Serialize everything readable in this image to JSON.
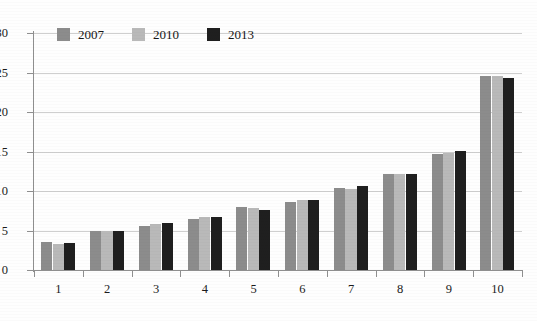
{
  "chart_data": {
    "type": "bar",
    "title": "",
    "subtitle": "",
    "xlabel": "",
    "ylabel": "",
    "categories": [
      "1",
      "2",
      "3",
      "4",
      "5",
      "6",
      "7",
      "8",
      "9",
      "10"
    ],
    "series": [
      {
        "name": "2007",
        "color": "#8c8c8c",
        "values": [
          3.6,
          5.0,
          5.6,
          6.5,
          8.0,
          8.6,
          10.4,
          12.2,
          14.7,
          24.6
        ]
      },
      {
        "name": "2010",
        "color": "#b9b9b9",
        "values": [
          3.3,
          5.0,
          5.8,
          6.7,
          7.9,
          8.9,
          10.2,
          12.2,
          14.8,
          24.6
        ]
      },
      {
        "name": "2013",
        "color": "#1f1f1f",
        "values": [
          3.4,
          5.0,
          6.0,
          6.7,
          7.6,
          8.9,
          10.6,
          12.1,
          15.1,
          24.3
        ]
      }
    ],
    "ylim": [
      0,
      30
    ],
    "yticks": [
      0,
      5,
      10,
      15,
      20,
      25,
      30
    ],
    "ytick_labels": [
      "0",
      "5",
      "10",
      "15",
      "20",
      "25",
      "30"
    ],
    "grid": true,
    "grid_axis": "y",
    "legend_position": "top-left"
  },
  "legend": {
    "items": [
      {
        "label": "2007",
        "color": "#8c8c8c"
      },
      {
        "label": "2010",
        "color": "#b9b9b9"
      },
      {
        "label": "2013",
        "color": "#1f1f1f"
      }
    ]
  },
  "colors": {
    "background": "#fefefe",
    "gridline": "#cfcfcf",
    "axis": "#8f8f8f",
    "text": "#1b1b1b"
  }
}
